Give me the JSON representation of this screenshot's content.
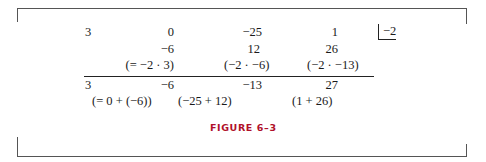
{
  "figure": {
    "caption": "FIGURE 6–3",
    "caption_color": "#b0102a",
    "divisor": "−2",
    "rows": {
      "coefficients": [
        "3",
        "0",
        "−25",
        "1"
      ],
      "products": [
        "−6",
        "12",
        "26"
      ],
      "product_notes": [
        "(= −2 · 3)",
        "(−2 · −6)",
        "(−2 · −13)"
      ],
      "results": [
        "3",
        "−6",
        "−13",
        "27"
      ],
      "sum_notes": [
        "(= 0 + (−6))",
        "(−25 + 12)",
        "(1 + 26)"
      ]
    }
  }
}
